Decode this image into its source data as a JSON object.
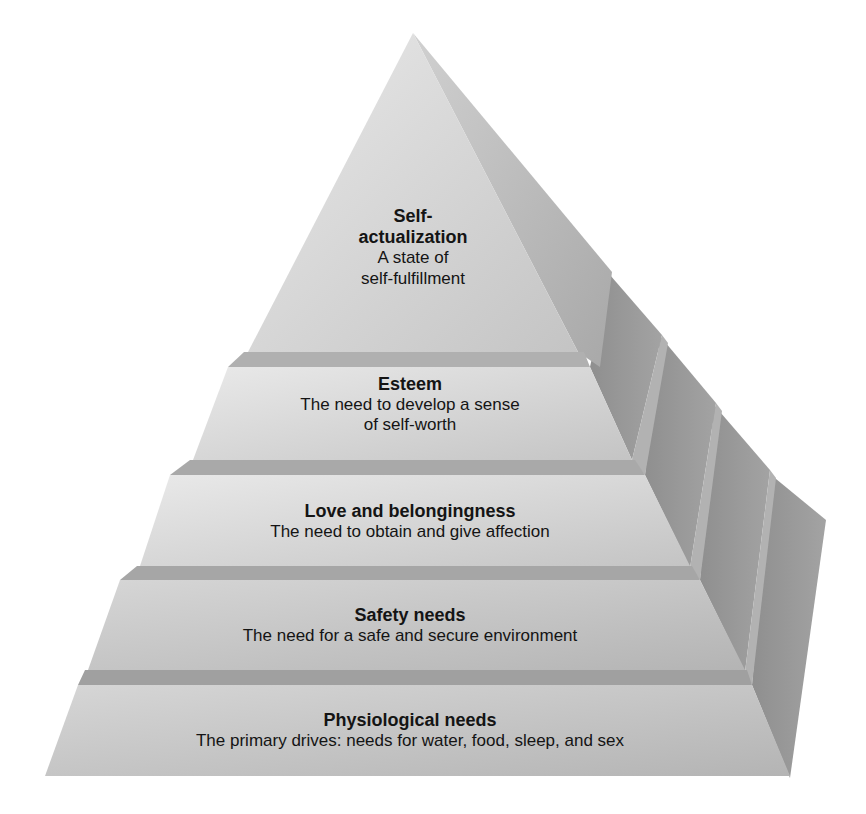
{
  "diagram": {
    "type": "pyramid",
    "colors": {
      "background": "#ffffff",
      "front_face_top": "#e4e4e4",
      "front_face_bottom": "#b9b9b9",
      "ledge": "#a6a6a6",
      "side_face_light": "#9c9c9c",
      "side_face_dark": "#8a8a8a",
      "text": "#141414"
    },
    "tiers": [
      {
        "level": 5,
        "title": "Self-",
        "title_line2": "actualization",
        "description": "A state of",
        "description_line2": "self-fulfillment"
      },
      {
        "level": 4,
        "title": "Esteem",
        "description": "The need to develop a sense",
        "description_line2": "of self-worth"
      },
      {
        "level": 3,
        "title": "Love and belongingness",
        "description": "The need to obtain and give affection"
      },
      {
        "level": 2,
        "title": "Safety needs",
        "description": "The need for a safe and secure environment"
      },
      {
        "level": 1,
        "title": "Physiological needs",
        "description": "The primary drives: needs for water, food, sleep, and sex"
      }
    ]
  }
}
